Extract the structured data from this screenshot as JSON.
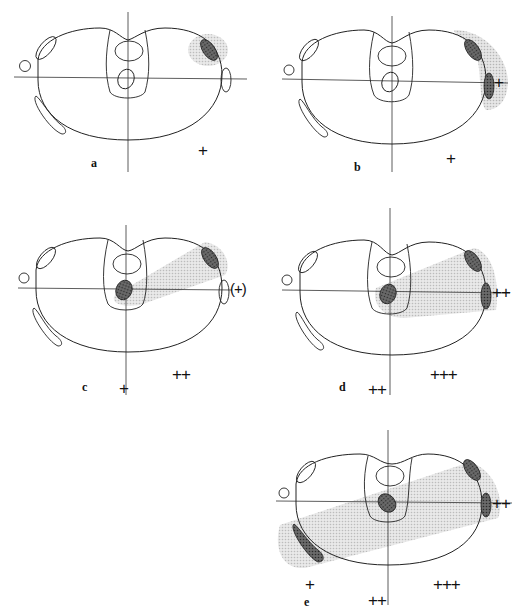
{
  "figure": {
    "panels": [
      {
        "id": "a",
        "label": "a",
        "signs": {
          "right_lower": "+"
        }
      },
      {
        "id": "b",
        "label": "b",
        "signs": {
          "right_lower": "+",
          "lateral": "+"
        }
      },
      {
        "id": "c",
        "label": "c",
        "signs": {
          "center_lower": "+",
          "right_lower": "++",
          "lateral": "(+)"
        }
      },
      {
        "id": "d",
        "label": "d",
        "signs": {
          "center_lower": "++",
          "right_lower": "+++",
          "lateral": "++"
        }
      },
      {
        "id": "e",
        "label": "e",
        "signs": {
          "left_lower": "+",
          "center_lower": "++",
          "right_lower": "+++",
          "lateral": "++"
        }
      }
    ],
    "colors": {
      "stroke": "#222222",
      "shade": "#cfcfcf",
      "lesion": "#555555"
    }
  }
}
